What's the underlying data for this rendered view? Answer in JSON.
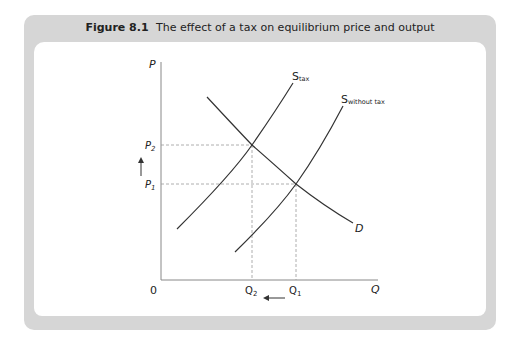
{
  "figure": {
    "number": "Figure 8.1",
    "title": "The effect of a tax on equilibrium price and output"
  },
  "axes": {
    "y_label": "P",
    "x_label": "Q",
    "origin_label": "0"
  },
  "price_labels": {
    "p2_main": "P",
    "p2_sub": "2",
    "p1_main": "P",
    "p1_sub": "1"
  },
  "quantity_labels": {
    "q2_main": "Q",
    "q2_sub": "2",
    "q1_main": "Q",
    "q1_sub": "1"
  },
  "curves": {
    "supply_tax_main": "S",
    "supply_tax_sub": "tax",
    "supply_no_tax_main": "S",
    "supply_no_tax_sub": "without tax",
    "demand": "D"
  },
  "annotations": {
    "price_change": "up-arrow",
    "quantity_change": "left-arrow"
  },
  "colors": {
    "frame": "#d6d6d6",
    "line": "#333333",
    "axis": "#888888",
    "guide": "#999999"
  }
}
